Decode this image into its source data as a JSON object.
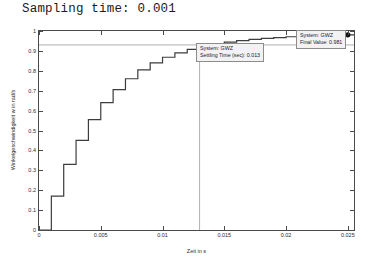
{
  "title": "Sampling time: 0.001",
  "chart_data": {
    "type": "line",
    "title": "Sampling time: 0.001",
    "xlabel": "Zeit in s",
    "ylabel": "Winkelgeschwindigkeit w in rad/s",
    "xlim": [
      0,
      0.0255
    ],
    "ylim": [
      0,
      1.0
    ],
    "grid": false,
    "legend": null,
    "style": "staircase-zoh",
    "sampling_time": 0.001,
    "xticks": [
      "0",
      "0.005",
      "0.01",
      "0.015",
      "0.02",
      "0.025"
    ],
    "xtick_values": [
      0,
      0.005,
      0.01,
      0.015,
      0.02,
      0.025
    ],
    "yticks": [
      "0",
      "0.1",
      "0.2",
      "0.3",
      "0.4",
      "0.5",
      "0.6",
      "0.7",
      "0.8",
      "0.9",
      "1"
    ],
    "ytick_values": [
      0,
      0.1,
      0.2,
      0.3,
      0.4,
      0.5,
      0.6,
      0.7,
      0.8,
      0.9,
      1
    ],
    "x": [
      0,
      0.001,
      0.002,
      0.003,
      0.004,
      0.005,
      0.006,
      0.007,
      0.008,
      0.009,
      0.01,
      0.011,
      0.012,
      0.013,
      0.014,
      0.015,
      0.016,
      0.017,
      0.018,
      0.019,
      0.02,
      0.021,
      0.022,
      0.023,
      0.024,
      0.025
    ],
    "values": [
      0,
      0.17,
      0.33,
      0.45,
      0.555,
      0.64,
      0.705,
      0.76,
      0.805,
      0.84,
      0.868,
      0.89,
      0.908,
      0.923,
      0.935,
      0.944,
      0.952,
      0.958,
      0.963,
      0.967,
      0.971,
      0.974,
      0.976,
      0.978,
      0.98,
      0.981
    ],
    "reference_line": {
      "y": 0.93,
      "orientation": "horizontal",
      "color": "#b0b0b0"
    },
    "markers": [
      {
        "name": "settling-point",
        "x": 0.013,
        "y": 0.923
      },
      {
        "name": "final-value-point",
        "x": 0.025,
        "y": 0.981
      }
    ],
    "annotations": [
      {
        "name": "final-value-datatip",
        "system_label": "System: GWZ",
        "value_label": "Final Value: 0.981",
        "x": 0.025,
        "y": 0.981
      },
      {
        "name": "settling-time-datatip",
        "system_label": "System: GWZ",
        "value_label": "Settling Time (sec): 0.013",
        "x": 0.013,
        "y": 0.923
      }
    ]
  },
  "annotation_final": {
    "system": "System: GWZ",
    "value": "Final Value: 0.981"
  },
  "annotation_settling": {
    "system": "System: GWZ",
    "value": "Settling Time (sec): 0.013"
  },
  "axis": {
    "xlabel": "Zeit in s",
    "ylabel": "Winkelgeschwindigkeit w in rad/s"
  },
  "colors": {
    "curve": "#3d3d3d",
    "axis": "#4a4a4a",
    "reference": "#b0b0b0",
    "datatip_bg": "#f2f2f2",
    "datatip_border": "#8c8c8c",
    "text": "#1a1a1a"
  }
}
